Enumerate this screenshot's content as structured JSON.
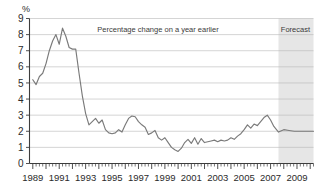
{
  "chart_data": {
    "type": "line",
    "title": "",
    "annotation": "Percentage change on a year earlier",
    "forecast_label": "Forecast",
    "xlabel": "",
    "ylabel": "%",
    "ylim": [
      0,
      9
    ],
    "xlim": [
      1988.75,
      2010.25
    ],
    "yticks": [
      0,
      1,
      2,
      3,
      4,
      5,
      6,
      7,
      8,
      9
    ],
    "ytick_labels": [
      "0",
      "1",
      "2",
      "3",
      "4",
      "5",
      "6",
      "7",
      "8",
      "9"
    ],
    "xtick_labels": [
      "1989",
      "1991",
      "1993",
      "1995",
      "1997",
      "1999",
      "2001",
      "2003",
      "2005",
      "2007",
      "2009"
    ],
    "xtick_values": [
      1989,
      1991,
      1993,
      1995,
      1997,
      1999,
      2001,
      2003,
      2005,
      2007,
      2009
    ],
    "grid": "horizontal",
    "legend": "none",
    "line_color": "#7a7a7a",
    "forecast_band_color": "#e6e6e6",
    "forecast_start": 2007.6,
    "series": [
      {
        "name": "Percentage change on a year earlier",
        "x": [
          1989.0,
          1989.25,
          1989.5,
          1989.75,
          1990.0,
          1990.25,
          1990.5,
          1990.75,
          1991.0,
          1991.25,
          1991.5,
          1991.75,
          1992.0,
          1992.25,
          1992.5,
          1992.75,
          1993.0,
          1993.25,
          1993.5,
          1993.75,
          1994.0,
          1994.25,
          1994.5,
          1994.75,
          1995.0,
          1995.25,
          1995.5,
          1995.75,
          1996.0,
          1996.25,
          1996.5,
          1996.75,
          1997.0,
          1997.25,
          1997.5,
          1997.75,
          1998.0,
          1998.25,
          1998.5,
          1998.75,
          1999.0,
          1999.25,
          1999.5,
          1999.75,
          2000.0,
          2000.25,
          2000.5,
          2000.75,
          2001.0,
          2001.25,
          2001.5,
          2001.75,
          2002.0,
          2002.25,
          2002.5,
          2002.75,
          2003.0,
          2003.25,
          2003.5,
          2003.75,
          2004.0,
          2004.25,
          2004.5,
          2004.75,
          2005.0,
          2005.25,
          2005.5,
          2005.75,
          2006.0,
          2006.25,
          2006.5,
          2006.75,
          2007.0,
          2007.25,
          2007.6,
          2008.0,
          2008.4,
          2008.8,
          2009.2,
          2009.6,
          2010.0,
          2010.25
        ],
        "values": [
          5.2,
          4.9,
          5.4,
          5.6,
          6.2,
          7.0,
          7.6,
          8.0,
          7.4,
          8.4,
          7.9,
          7.2,
          7.1,
          7.1,
          5.6,
          4.2,
          3.1,
          2.4,
          2.6,
          2.8,
          2.5,
          2.7,
          2.1,
          1.9,
          1.85,
          1.9,
          2.1,
          1.95,
          2.4,
          2.8,
          2.95,
          2.9,
          2.6,
          2.4,
          2.25,
          1.8,
          1.9,
          2.05,
          1.6,
          1.45,
          1.6,
          1.3,
          1.0,
          0.85,
          0.75,
          0.95,
          1.3,
          1.5,
          1.25,
          1.6,
          1.2,
          1.55,
          1.3,
          1.35,
          1.4,
          1.45,
          1.35,
          1.45,
          1.4,
          1.45,
          1.6,
          1.5,
          1.7,
          1.85,
          2.1,
          2.4,
          2.2,
          2.45,
          2.35,
          2.6,
          2.85,
          3.0,
          2.7,
          2.3,
          1.95,
          2.1,
          2.05,
          2.0,
          2.0,
          2.0,
          2.0,
          2.0
        ]
      }
    ]
  }
}
